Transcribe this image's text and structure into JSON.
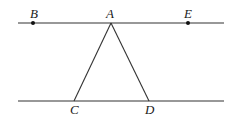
{
  "diagram": {
    "points": {
      "B": {
        "label": "B",
        "x": 33,
        "y": 23
      },
      "A": {
        "label": "A",
        "x": 111,
        "y": 23
      },
      "E": {
        "label": "E",
        "x": 188,
        "y": 23
      },
      "C": {
        "label": "C",
        "x": 74,
        "y": 101
      },
      "D": {
        "label": "D",
        "x": 149,
        "y": 101
      }
    },
    "lines": [
      {
        "name": "top-line",
        "from": [
          18,
          23
        ],
        "to": [
          224,
          23
        ]
      },
      {
        "name": "bottom-line",
        "from": [
          18,
          101
        ],
        "to": [
          224,
          101
        ]
      },
      {
        "name": "segment-AC",
        "from": "A",
        "to": "C"
      },
      {
        "name": "segment-AD",
        "from": "A",
        "to": "D"
      }
    ],
    "marked_points": [
      "B",
      "E"
    ],
    "colors": {
      "line": "#333333",
      "point": "#111111",
      "label": "#1a1a1a"
    }
  }
}
